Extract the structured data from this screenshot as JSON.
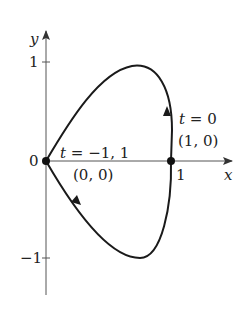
{
  "diagram": {
    "type": "parametric-curve",
    "axes": {
      "x_label": "x",
      "y_label": "y",
      "origin_label": "0",
      "x_ticks": [
        {
          "value": 1,
          "label": "1"
        }
      ],
      "y_ticks": [
        {
          "value": 1,
          "label": "1"
        },
        {
          "value": -1,
          "label": "−1"
        }
      ]
    },
    "points": [
      {
        "name": "origin",
        "t_label": "t = −1, 1",
        "coord_label": "(0, 0)"
      },
      {
        "name": "x-intercept",
        "t_label": "t = 0",
        "coord_label": "(1, 0)"
      }
    ],
    "direction_arrows": [
      "upward at right branch",
      "down-right on lower branch"
    ],
    "colors": {
      "curve": "#1a1a1a",
      "axis": "#444444",
      "text": "#222222"
    }
  }
}
